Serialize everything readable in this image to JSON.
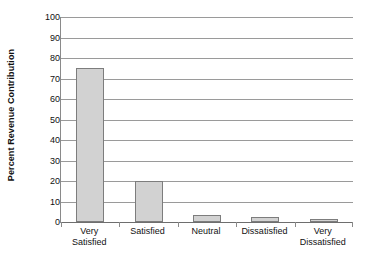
{
  "chart_data": {
    "type": "bar",
    "title": "",
    "xlabel": "",
    "ylabel": "Percent Revenue Contribution",
    "categories": [
      "Very Satisfied",
      "Satisfied",
      "Neutral",
      "Dissatisfied",
      "Very Dissatisfied"
    ],
    "category_lines": [
      [
        "Very",
        "Satisfied"
      ],
      [
        "Satisfied",
        ""
      ],
      [
        "Neutral",
        ""
      ],
      [
        "Dissatisfied",
        ""
      ],
      [
        "Very",
        "Dissatisfied"
      ]
    ],
    "values": [
      75,
      20,
      3.5,
      2.5,
      1.5
    ],
    "ylim": [
      0,
      100
    ],
    "yticks": [
      0,
      10,
      20,
      30,
      40,
      50,
      60,
      70,
      80,
      90,
      100
    ],
    "ytick_labels": [
      "0",
      "10",
      "20",
      "30",
      "40",
      "50",
      "60",
      "70",
      "80",
      "90",
      "100"
    ],
    "grid": true,
    "grid_axis": "y",
    "legend": false,
    "legend_position": "none",
    "bar_fill_color": "#d2d2d2",
    "bar_border_color": "#7d7d7d",
    "grid_color": "#9a9a9a",
    "axis_color": "#8a8a8a",
    "background_color": "#ffffff",
    "text_color": "#111111"
  },
  "axis": {
    "y_title": "Percent Revenue Contribution"
  }
}
